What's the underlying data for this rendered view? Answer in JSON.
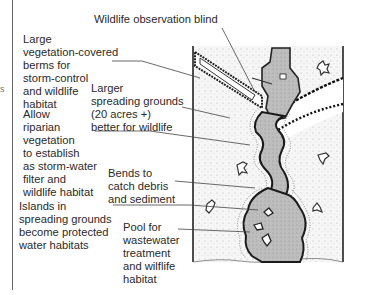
{
  "figure": {
    "type": "annotated site plan",
    "labels": {
      "blind": "Wildlife observation blind",
      "berms": "Large\nvegetation-covered\nberms for\nstorm-control\nand wildlife\nhabitat",
      "spreading": "Larger\nspreading grounds\n(20 acres +)\nbetter for wildlife",
      "riparian": "Allow\nriparian\nvegetation\nto establish\nas storm-water\nfilter and\nwildlife habitat",
      "bends": "Bends to\ncatch debris\nand sediment",
      "islands": "Islands in\nspreading grounds\nbecome protected\nwater habitats",
      "pool": "Pool for\nwastewater\ntreatment\nand wilflife\nhabitat"
    },
    "edge_mark": "s",
    "colors": {
      "ink": "#1e1e1e",
      "water": "#b9b9b9",
      "ground": "#f4f4f4",
      "leader": "#444444"
    }
  }
}
